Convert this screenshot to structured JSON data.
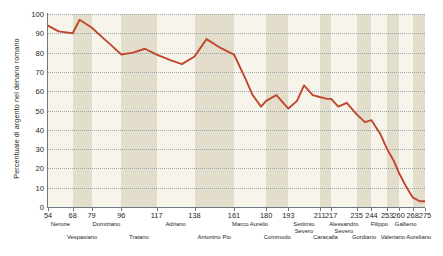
{
  "chart_data": {
    "type": "line",
    "title": "",
    "xlabel": "",
    "ylabel": "Percentuale di argento nel denario romano",
    "ylim": [
      0,
      100
    ],
    "xlim": [
      54,
      275
    ],
    "ytick_labels": [
      "100",
      "90",
      "80",
      "70",
      "60",
      "50",
      "40",
      "30",
      "20",
      "10",
      "0"
    ],
    "ytick_values": [
      100,
      90,
      80,
      70,
      60,
      50,
      40,
      30,
      20,
      10,
      0
    ],
    "xtick_labels": [
      "54",
      "68",
      "79",
      "96",
      "117",
      "138",
      "161",
      "180",
      "193",
      "211",
      "217",
      "235",
      "244",
      "253",
      "260",
      "268",
      "275"
    ],
    "xtick_values": [
      54,
      68,
      79,
      96,
      117,
      138,
      161,
      180,
      193,
      211,
      217,
      235,
      244,
      253,
      260,
      268,
      275
    ],
    "grid": "horizontal-dotted",
    "legend": "none",
    "line_color": "#c0472f",
    "band_color_dark": "#e3ddcb",
    "band_color_light": "#f7f4ec",
    "x": [
      54,
      60,
      68,
      72,
      79,
      85,
      90,
      96,
      103,
      110,
      117,
      125,
      131,
      138,
      145,
      152,
      161,
      168,
      172,
      177,
      180,
      186,
      193,
      198,
      202,
      207,
      211,
      215,
      217,
      222,
      228,
      235,
      240,
      244,
      249,
      253,
      257,
      260,
      264,
      268,
      272,
      275
    ],
    "y": [
      94,
      91,
      90,
      97,
      93,
      88,
      84,
      79,
      80,
      82,
      79,
      76,
      74,
      78,
      87,
      83,
      79,
      66,
      58,
      52,
      55,
      58,
      51,
      55,
      63,
      58,
      57,
      56,
      56,
      52,
      54,
      48,
      44,
      45,
      38,
      30,
      24,
      18,
      11,
      5,
      3,
      3
    ],
    "series": [
      {
        "name": "Percentuale di argento nel denario romano",
        "points": [
          [
            54,
            94
          ],
          [
            60,
            91
          ],
          [
            68,
            90
          ],
          [
            72,
            97
          ],
          [
            79,
            93
          ],
          [
            85,
            88
          ],
          [
            90,
            84
          ],
          [
            96,
            79
          ],
          [
            103,
            80
          ],
          [
            110,
            82
          ],
          [
            117,
            79
          ],
          [
            125,
            76
          ],
          [
            131,
            74
          ],
          [
            138,
            78
          ],
          [
            145,
            87
          ],
          [
            152,
            83
          ],
          [
            161,
            79
          ],
          [
            168,
            66
          ],
          [
            172,
            58
          ],
          [
            177,
            52
          ],
          [
            180,
            55
          ],
          [
            186,
            58
          ],
          [
            193,
            51
          ],
          [
            198,
            55
          ],
          [
            202,
            63
          ],
          [
            207,
            58
          ],
          [
            211,
            57
          ],
          [
            215,
            56
          ],
          [
            217,
            56
          ],
          [
            222,
            52
          ],
          [
            228,
            54
          ],
          [
            235,
            48
          ],
          [
            240,
            44
          ],
          [
            244,
            45
          ],
          [
            249,
            38
          ],
          [
            253,
            30
          ],
          [
            257,
            24
          ],
          [
            260,
            18
          ],
          [
            264,
            11
          ],
          [
            268,
            5
          ],
          [
            272,
            3
          ],
          [
            275,
            3
          ]
        ]
      }
    ],
    "bands": [
      {
        "from": 54,
        "to": 68,
        "shade": "light"
      },
      {
        "from": 68,
        "to": 79,
        "shade": "dark"
      },
      {
        "from": 79,
        "to": 96,
        "shade": "light"
      },
      {
        "from": 96,
        "to": 117,
        "shade": "dark"
      },
      {
        "from": 117,
        "to": 138,
        "shade": "light"
      },
      {
        "from": 138,
        "to": 161,
        "shade": "dark"
      },
      {
        "from": 161,
        "to": 180,
        "shade": "light"
      },
      {
        "from": 180,
        "to": 193,
        "shade": "dark"
      },
      {
        "from": 193,
        "to": 211,
        "shade": "light"
      },
      {
        "from": 211,
        "to": 217,
        "shade": "dark"
      },
      {
        "from": 217,
        "to": 235,
        "shade": "light"
      },
      {
        "from": 235,
        "to": 244,
        "shade": "dark"
      },
      {
        "from": 244,
        "to": 253,
        "shade": "light"
      },
      {
        "from": 253,
        "to": 260,
        "shade": "dark"
      },
      {
        "from": 260,
        "to": 268,
        "shade": "light"
      },
      {
        "from": 268,
        "to": 275,
        "shade": "dark"
      }
    ],
    "emperors": [
      {
        "label": "Nerone",
        "at": 61,
        "row": 0
      },
      {
        "label": "Vespasiano",
        "at": 73.5,
        "row": 1
      },
      {
        "label": "Domiziano",
        "at": 87.5,
        "row": 0
      },
      {
        "label": "Traiano",
        "at": 106.5,
        "row": 1
      },
      {
        "label": "Adriano",
        "at": 127.5,
        "row": 0
      },
      {
        "label": "Antonino Pio",
        "at": 149.5,
        "row": 1
      },
      {
        "label": "Marco Aurelio",
        "at": 170.5,
        "row": 0
      },
      {
        "label": "Commodo",
        "at": 186.5,
        "row": 1
      },
      {
        "label": "Settimio",
        "label2": "Severo",
        "at": 202,
        "row": 0
      },
      {
        "label": "Caracalla",
        "at": 214,
        "row": 1
      },
      {
        "label": "Alessandro",
        "label2": "Severo",
        "at": 226,
        "row": 0
      },
      {
        "label": "Gordiano",
        "at": 239.5,
        "row": 1
      },
      {
        "label": "Filippo",
        "at": 248.5,
        "row": 0
      },
      {
        "label": "Valeriano",
        "at": 256.5,
        "row": 1
      },
      {
        "label": "Gallieno",
        "at": 264,
        "row": 0
      },
      {
        "label": "Aureliano",
        "at": 271.5,
        "row": 1
      }
    ]
  }
}
